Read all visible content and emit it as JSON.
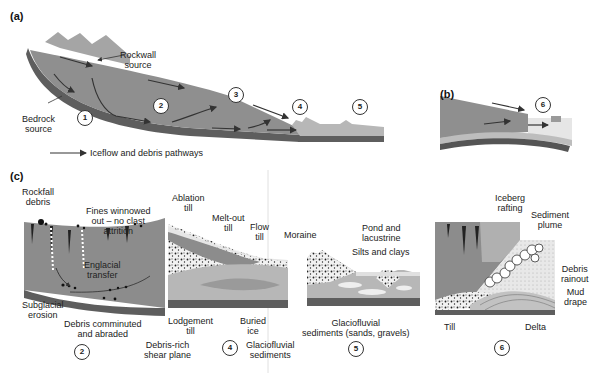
{
  "panels": {
    "a": {
      "label": "(a)",
      "labels": {
        "rockwall": [
          "Rockwall",
          "source"
        ],
        "bedrock": [
          "Bedrock",
          "source"
        ],
        "legend": "Iceflow and debris pathways"
      },
      "zones": [
        "1",
        "2",
        "3",
        "4",
        "5"
      ]
    },
    "b": {
      "label": "(b)",
      "zones": [
        "6"
      ]
    },
    "c": {
      "label": "(c)",
      "sections": [
        {
          "zone": "2",
          "labels": {
            "rockfall": [
              "Rockfall",
              "debris"
            ],
            "fines": [
              "Fines winnowed",
              "out – no clast",
              "attrition"
            ],
            "englacial": [
              "Englacial",
              "transfer"
            ],
            "subglacial": [
              "Subglacial",
              "erosion"
            ],
            "comminuted": [
              "Debris comminuted",
              "and abraded"
            ]
          }
        },
        {
          "zone": "4",
          "labels": {
            "ablation": [
              "Ablation",
              "till"
            ],
            "meltout": [
              "Melt-out",
              "till"
            ],
            "flow": [
              "Flow",
              "till"
            ],
            "lodgement": [
              "Lodgement",
              "till"
            ],
            "shear": [
              "Debris-rich",
              "shear plane"
            ],
            "buried": [
              "Buried",
              "ice"
            ],
            "glaciofluvial": [
              "Glaciofluvial",
              "sediments"
            ]
          }
        },
        {
          "zone": "5",
          "labels": {
            "moraine": "Moraine",
            "pond": [
              "Pond and",
              "lacustrine"
            ],
            "silts": "Silts and clays",
            "glaciofluvial": [
              "Glaciofluvial",
              "sediments (sands, gravels)"
            ]
          }
        },
        {
          "zone": "6",
          "labels": {
            "iceberg": [
              "Iceberg",
              "rafting"
            ],
            "plume": [
              "Sediment",
              "plume"
            ],
            "rainout": [
              "Debris",
              "rainout"
            ],
            "mud": [
              "Mud",
              "drape"
            ],
            "till": "Till",
            "delta": "Delta"
          }
        }
      ]
    }
  },
  "colors": {
    "ice": "#8c8c8c",
    "ice_light": "#a8a8a8",
    "bedrock": "#555555",
    "sediment": "#b5b5b5",
    "water": "#dedede",
    "arrow": "#333333"
  }
}
